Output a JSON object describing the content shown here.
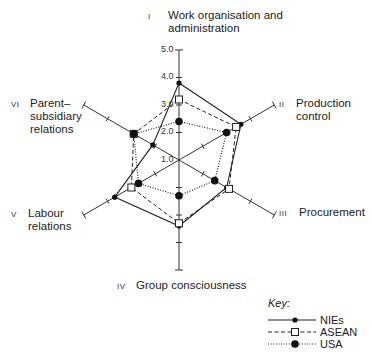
{
  "chart_data": {
    "type": "radar",
    "title": "",
    "scale": {
      "min": 1.0,
      "max": 5.0,
      "tick_labels": [
        "1.0",
        "2.0",
        "3.0",
        "4.0",
        "5.0"
      ]
    },
    "axes": [
      {
        "numeral": "I",
        "label": "Work organisation and administration"
      },
      {
        "numeral": "II",
        "label": "Production control"
      },
      {
        "numeral": "III",
        "label": "Procurement"
      },
      {
        "numeral": "IV",
        "label": "Group consciousness"
      },
      {
        "numeral": "V",
        "label": "Labour relations"
      },
      {
        "numeral": "VI",
        "label": "Parent–subsidiary relations"
      }
    ],
    "series": [
      {
        "name": "NIEs",
        "line": "solid",
        "marker": "small-filled-dot",
        "values": [
          3.8,
          3.6,
          3.0,
          3.4,
          3.7,
          2.1
        ]
      },
      {
        "name": "ASEAN",
        "line": "dashed",
        "marker": "open-square",
        "values": [
          3.2,
          3.4,
          3.1,
          3.3,
          3.0,
          2.9
        ]
      },
      {
        "name": "USA",
        "line": "dotted",
        "marker": "filled-circle",
        "values": [
          2.4,
          3.0,
          2.5,
          2.3,
          2.7,
          2.9
        ]
      }
    ],
    "legend": {
      "title": "Key:",
      "position": "bottom-right"
    }
  },
  "labels": {
    "axis1_num": "I",
    "axis1_line1": "Work organisation and",
    "axis1_line2": "administration",
    "axis2_num": "II",
    "axis2_line1": "Production",
    "axis2_line2": "control",
    "axis3_num": "III",
    "axis3_line1": "Procurement",
    "axis4_num": "IV",
    "axis4_line1": "Group consciousness",
    "axis5_num": "V",
    "axis5_line1": "Labour",
    "axis5_line2": "relations",
    "axis6_num": "VI",
    "axis6_line1": "Parent–",
    "axis6_line2": "subsidiary",
    "axis6_line3": "relations"
  },
  "ticks": {
    "t1": "1.0",
    "t2": "2.0",
    "t3": "3.0",
    "t4": "4.0",
    "t5": "5.0"
  },
  "key": {
    "title": "Key:",
    "s1": "NIEs",
    "s2": "ASEAN",
    "s3": "USA"
  }
}
